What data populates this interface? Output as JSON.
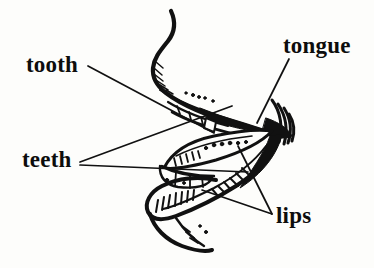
{
  "figure": {
    "kind": "anatomical-line-drawing",
    "width": 374,
    "height": 268,
    "background_color": "#fdfdfb",
    "ink_color": "#0d0d0d"
  },
  "labels": {
    "tooth": "tooth",
    "teeth": "teeth",
    "tongue": "tongue",
    "lips": "lips"
  },
  "parts": [
    {
      "name": "upper-lip",
      "label": "lips"
    },
    {
      "name": "lower-lip",
      "label": "lips"
    },
    {
      "name": "tongue",
      "label": "tongue"
    },
    {
      "name": "upper-teeth",
      "label": "teeth"
    },
    {
      "name": "lower-teeth",
      "label": "teeth"
    },
    {
      "name": "single-tooth",
      "label": "tooth"
    }
  ],
  "leaders": {
    "tooth": [
      [
        88,
        66
      ],
      [
        214,
        133
      ]
    ],
    "teeth": [
      [
        80,
        162
      ],
      [
        232,
        106
      ]
    ],
    "teeth2": [
      [
        80,
        165
      ],
      [
        246,
        170
      ]
    ],
    "tongue": [
      [
        289,
        60
      ],
      [
        258,
        122
      ]
    ],
    "lips": [
      [
        272,
        214
      ],
      [
        204,
        188
      ]
    ],
    "lips2": [
      [
        272,
        214
      ],
      [
        240,
        150
      ]
    ]
  }
}
